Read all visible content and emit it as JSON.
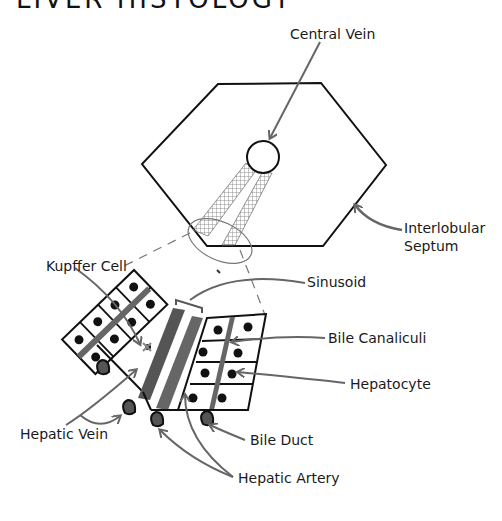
{
  "title": "LIVER HISTOLOGY",
  "labels": {
    "central_vein": "Central Vein",
    "interlobular_septum_1": "Interlobular",
    "interlobular_septum_2": "Septum",
    "kupffer_cell": "Kupffer Cell",
    "sinusoid": "Sinusoid",
    "bile_canaliculi": "Bile Canaliculi",
    "hepatocyte": "Hepatocyte",
    "hepatic_vein": "Hepatic Vein",
    "bile_duct": "Bile Duct",
    "hepatic_artery": "Hepatic Artery"
  },
  "colors": {
    "ink": "#111111",
    "arrow": "#666666",
    "sinusoid_band": "#555555",
    "canaliculi_band": "#707070",
    "vessel_fill": "#555555"
  }
}
